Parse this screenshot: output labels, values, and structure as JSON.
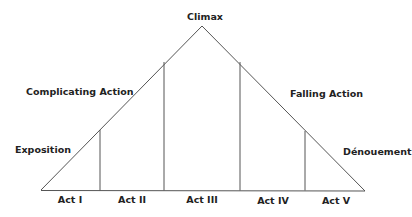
{
  "diagram": {
    "type": "freytag-pyramid",
    "stages": {
      "climax": "Climax",
      "complicating_action": "Complicating Action",
      "exposition": "Exposition",
      "falling_action": "Falling Action",
      "denouement": "Dénouement"
    },
    "acts": [
      "Act I",
      "Act II",
      "Act III",
      "Act IV",
      "Act V"
    ],
    "colors": {
      "line": "#555555",
      "text": "#222222",
      "background": "#ffffff"
    }
  }
}
